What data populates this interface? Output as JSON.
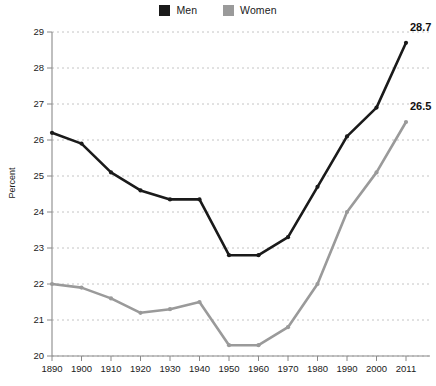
{
  "legend": {
    "position": "top-center",
    "entries": [
      {
        "label": "Men",
        "color": "#1a1a1a",
        "swatch": "legend-swatch-men"
      },
      {
        "label": "Women",
        "color": "#9a9a9a",
        "swatch": "legend-swatch-women"
      }
    ]
  },
  "axis": {
    "ylabel": "Percent",
    "yticks": [
      "20",
      "21",
      "22",
      "23",
      "24",
      "25",
      "26",
      "27",
      "28",
      "29"
    ],
    "xticks": [
      "1890",
      "1900",
      "1910",
      "1920",
      "1930",
      "1940",
      "1950",
      "1960",
      "1970",
      "1980",
      "1990",
      "2000",
      "2011"
    ]
  },
  "annotations": {
    "men_end": "28.7",
    "women_end": "26.5"
  },
  "colors": {
    "men": "#1a1a1a",
    "women": "#9a9a9a",
    "grid": "#bdbdbd",
    "axis": "#8a8a8a",
    "background": "#ffffff"
  },
  "chart_data": {
    "type": "line",
    "title": "",
    "subtitle": "",
    "xlabel": "",
    "ylabel": "Percent",
    "categories": [
      "1890",
      "1900",
      "1910",
      "1920",
      "1930",
      "1940",
      "1950",
      "1960",
      "1970",
      "1980",
      "1990",
      "2000",
      "2011"
    ],
    "x": [
      1890,
      1900,
      1910,
      1920,
      1930,
      1940,
      1950,
      1960,
      1970,
      1980,
      1990,
      2000,
      2011
    ],
    "series": [
      {
        "name": "Men",
        "color": "#1a1a1a",
        "values": [
          26.2,
          25.9,
          25.1,
          24.6,
          24.35,
          24.35,
          22.8,
          22.8,
          23.3,
          24.7,
          26.1,
          26.9,
          28.7
        ],
        "end_label": "28.7"
      },
      {
        "name": "Women",
        "color": "#9a9a9a",
        "values": [
          22.0,
          21.9,
          21.6,
          21.2,
          21.3,
          21.5,
          20.3,
          20.3,
          20.8,
          22.0,
          24.0,
          25.1,
          26.5
        ],
        "end_label": "26.5"
      }
    ],
    "ylim": [
      20,
      29
    ],
    "yticks": [
      20,
      21,
      22,
      23,
      24,
      25,
      26,
      27,
      28,
      29
    ],
    "grid": true,
    "grid_style": "dotted-horizontal",
    "legend": true,
    "legend_position": "top-center"
  }
}
